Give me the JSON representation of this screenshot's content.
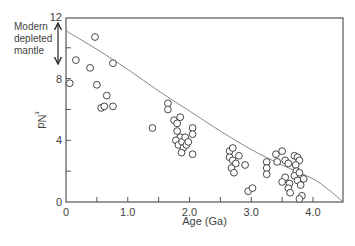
{
  "chart_data": {
    "type": "scatter",
    "title": "",
    "xlabel": "Age (Ga)",
    "ylabel": "εNd",
    "ylabel_main": "Nd",
    "ylabel_prefix": "ε",
    "xlim": [
      0,
      4.49
    ],
    "ylim": [
      0,
      12
    ],
    "x_ticks": [
      0,
      0.5,
      1.0,
      1.5,
      2.0,
      2.5,
      3.0,
      3.5,
      4.0
    ],
    "x_tick_labels": [
      "0",
      "",
      "1.0",
      "",
      "2.0",
      "",
      "3.0",
      "",
      "4.0"
    ],
    "y_ticks": [
      0,
      2,
      4,
      6,
      8,
      10,
      12
    ],
    "y_tick_labels": [
      "0",
      "",
      "4",
      "",
      "8",
      "",
      "12"
    ],
    "grid": false,
    "annotation": {
      "lines": [
        "Modern",
        "depleted",
        "mantle"
      ],
      "arrow_range": [
        9.8,
        12
      ]
    },
    "curve": {
      "name": "Depleted mantle evolution",
      "x": [
        0,
        0.5,
        1.0,
        1.5,
        2.0,
        2.5,
        3.0,
        3.5,
        4.0,
        4.25,
        4.49
      ],
      "y": [
        11.1,
        9.9,
        8.6,
        7.2,
        5.9,
        4.6,
        3.4,
        2.4,
        1.5,
        0.8,
        0
      ]
    },
    "series": [
      {
        "name": "Samples",
        "marker": "open-circle",
        "points": [
          [
            0.06,
            7.7
          ],
          [
            0.16,
            9.2
          ],
          [
            0.39,
            8.7
          ],
          [
            0.47,
            10.7
          ],
          [
            0.5,
            7.6
          ],
          [
            0.57,
            6.1
          ],
          [
            0.62,
            6.2
          ],
          [
            0.66,
            6.9
          ],
          [
            0.76,
            9.0
          ],
          [
            0.76,
            6.2
          ],
          [
            1.4,
            4.8
          ],
          [
            1.65,
            6.4
          ],
          [
            1.65,
            6.0
          ],
          [
            1.75,
            5.3
          ],
          [
            1.8,
            5.1
          ],
          [
            1.8,
            4.6
          ],
          [
            1.85,
            5.5
          ],
          [
            1.85,
            4.2
          ],
          [
            1.78,
            4.0
          ],
          [
            1.82,
            3.7
          ],
          [
            1.88,
            3.9
          ],
          [
            1.9,
            3.5
          ],
          [
            1.87,
            3.2
          ],
          [
            1.95,
            3.7
          ],
          [
            2.05,
            4.8
          ],
          [
            2.05,
            4.4
          ],
          [
            2.05,
            3.1
          ],
          [
            1.93,
            4.2
          ],
          [
            1.98,
            3.9
          ],
          [
            2.65,
            3.3
          ],
          [
            2.7,
            3.5
          ],
          [
            2.65,
            2.9
          ],
          [
            2.7,
            2.7
          ],
          [
            2.75,
            2.5
          ],
          [
            2.68,
            2.2
          ],
          [
            2.72,
            1.9
          ],
          [
            2.8,
            3.0
          ],
          [
            2.9,
            2.4
          ],
          [
            2.95,
            0.7
          ],
          [
            3.02,
            0.9
          ],
          [
            3.25,
            2.6
          ],
          [
            3.25,
            2.2
          ],
          [
            3.25,
            1.8
          ],
          [
            3.4,
            3.1
          ],
          [
            3.42,
            2.6
          ],
          [
            3.5,
            3.3
          ],
          [
            3.55,
            2.7
          ],
          [
            3.6,
            2.5
          ],
          [
            3.7,
            3.0
          ],
          [
            3.75,
            2.9
          ],
          [
            3.78,
            2.7
          ],
          [
            3.72,
            2.4
          ],
          [
            3.73,
            2.0
          ],
          [
            3.7,
            1.7
          ],
          [
            3.75,
            1.4
          ],
          [
            3.62,
            1.2
          ],
          [
            3.6,
            0.9
          ],
          [
            3.55,
            1.6
          ],
          [
            3.5,
            1.3
          ],
          [
            3.63,
            0.6
          ],
          [
            3.8,
            1.1
          ],
          [
            3.82,
            0.4
          ],
          [
            3.78,
            0.2
          ],
          [
            3.85,
            1.5
          ],
          [
            3.78,
            1.9
          ]
        ]
      }
    ]
  }
}
